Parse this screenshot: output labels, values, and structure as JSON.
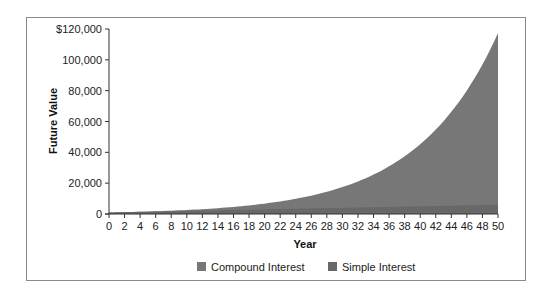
{
  "chart_data": {
    "type": "area",
    "title": "",
    "xlabel": "Year",
    "ylabel": "Future Value",
    "x": [
      0,
      2,
      4,
      6,
      8,
      10,
      12,
      14,
      16,
      18,
      20,
      22,
      24,
      26,
      28,
      30,
      32,
      34,
      36,
      38,
      40,
      42,
      44,
      46,
      48,
      50
    ],
    "series": [
      {
        "name": "Compound Interest",
        "color": "#777777",
        "values": [
          1000,
          1210,
          1464,
          1772,
          2144,
          2594,
          3138,
          3797,
          4595,
          5560,
          6727,
          8140,
          9850,
          11918,
          14421,
          17449,
          21114,
          25548,
          30913,
          37404,
          45259,
          54764,
          66264,
          80180,
          97017,
          117391
        ]
      },
      {
        "name": "Simple Interest",
        "color": "#686868",
        "values": [
          1000,
          1200,
          1400,
          1600,
          1800,
          2000,
          2200,
          2400,
          2600,
          2800,
          3000,
          3200,
          3400,
          3600,
          3800,
          4000,
          4200,
          4400,
          4600,
          4800,
          5000,
          5200,
          5400,
          5600,
          5800,
          6000
        ]
      }
    ],
    "y_ticks": [
      0,
      20000,
      40000,
      60000,
      80000,
      100000,
      120000
    ],
    "y_tick_labels": [
      "0",
      "20,000",
      "40,000",
      "60,000",
      "80,000",
      "100,000",
      "$120,000"
    ],
    "x_tick_labels": [
      "0",
      "2",
      "4",
      "6",
      "8",
      "10",
      "12",
      "14",
      "16",
      "18",
      "20",
      "22",
      "24",
      "26",
      "28",
      "30",
      "32",
      "34",
      "36",
      "38",
      "40",
      "42",
      "44",
      "46",
      "48",
      "50"
    ],
    "xlim": [
      0,
      50
    ],
    "ylim": [
      0,
      120000
    ],
    "grid": false,
    "legend_position": "bottom"
  },
  "legend": {
    "items": [
      {
        "label": "Compound Interest",
        "color": "#777777"
      },
      {
        "label": "Simple Interest",
        "color": "#686868"
      }
    ]
  },
  "axes": {
    "x_title": "Year",
    "y_title": "Future Value"
  }
}
